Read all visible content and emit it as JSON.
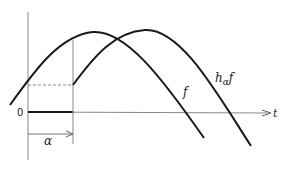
{
  "diagram": {
    "title": "",
    "axis_t_label": "t",
    "origin_label": "0",
    "shift_label": "α",
    "curves": [
      {
        "name": "f",
        "label": "f"
      },
      {
        "name": "h_alpha_f",
        "label_main": "h",
        "label_sub": "α",
        "label_tail": "f"
      }
    ],
    "colors": {
      "curve": "#1a1a1a",
      "axis": "#777777",
      "background": "#ffffff"
    }
  }
}
